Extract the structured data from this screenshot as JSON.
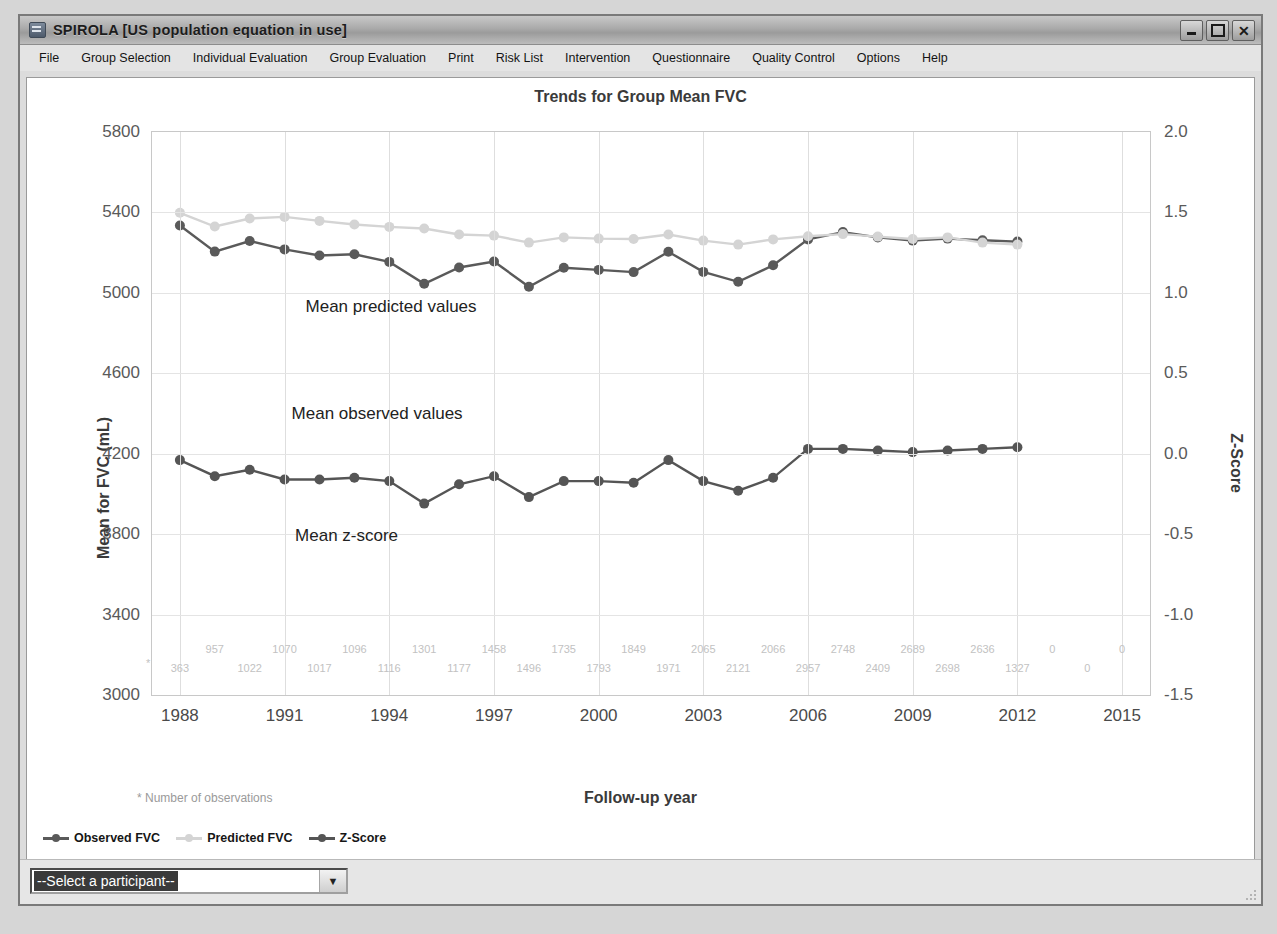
{
  "window": {
    "title": "SPIROLA  [US population equation in use]",
    "icon": "app-icon",
    "buttons": {
      "minimize": "minimize-icon",
      "maximize": "maximize-icon",
      "close": "close-icon"
    }
  },
  "menu": {
    "items": [
      "File",
      "Group Selection",
      "Individual Evaluation",
      "Group Evaluation",
      "Print",
      "Risk List",
      "Intervention",
      "Questionnaire",
      "Quality Control",
      "Options",
      "Help"
    ]
  },
  "statusbar": {
    "participant_select": "--Select a participant--",
    "dropdown_arrow": "chevron-down-icon"
  },
  "chart_data": {
    "type": "line",
    "title": "Trends for Group Mean FVC",
    "xlabel": "Follow-up year",
    "ylabel": "Mean for FVC (mL)",
    "ylabel_right": "Z-Score",
    "footnote": "* Number of observations",
    "grid": true,
    "legend_position": "bottom-left",
    "xlim": [
      1987.2,
      2015.8
    ],
    "xticks": [
      1988,
      1991,
      1994,
      1997,
      2000,
      2003,
      2006,
      2009,
      2012,
      2015
    ],
    "ylim": [
      3000,
      5800
    ],
    "yticks": [
      5800,
      5400,
      5000,
      4600,
      4200,
      3800,
      3400,
      3000
    ],
    "ylim_right": [
      -1.5,
      2.0
    ],
    "yticks_right": [
      "2.0",
      "1.5",
      "1.0",
      "0.5",
      "0.0",
      "-0.5",
      "-1.0",
      "-1.5"
    ],
    "x": [
      1988,
      1989,
      1990,
      1991,
      1992,
      1993,
      1994,
      1995,
      1996,
      1997,
      1998,
      1999,
      2000,
      2001,
      2002,
      2003,
      2004,
      2005,
      2006,
      2007,
      2008,
      2009,
      2010,
      2011,
      2012
    ],
    "series": [
      {
        "name": "Observed FVC",
        "axis": "left",
        "color": "#5a5a5a",
        "values": [
          5335,
          5205,
          5258,
          5216,
          5186,
          5192,
          5154,
          5045,
          5126,
          5156,
          5030,
          5125,
          5114,
          5103,
          5204,
          5104,
          5055,
          5137,
          5266,
          5302,
          5276,
          5260,
          5270,
          5262,
          5255
        ]
      },
      {
        "name": "Predicted FVC",
        "axis": "left",
        "color": "#d4d4d4",
        "values": [
          5398,
          5330,
          5370,
          5378,
          5358,
          5340,
          5328,
          5320,
          5290,
          5285,
          5250,
          5276,
          5270,
          5268,
          5290,
          5260,
          5240,
          5266,
          5282,
          5292,
          5280,
          5268,
          5276,
          5250,
          5240
        ]
      },
      {
        "name": "Z-Score",
        "axis": "right",
        "color": "#555555",
        "values": [
          -0.04,
          -0.14,
          -0.1,
          -0.16,
          -0.16,
          -0.15,
          -0.17,
          -0.31,
          -0.19,
          -0.14,
          -0.27,
          -0.17,
          -0.17,
          -0.18,
          -0.04,
          -0.17,
          -0.23,
          -0.15,
          0.03,
          0.03,
          0.02,
          0.01,
          0.02,
          0.03,
          0.04
        ]
      }
    ],
    "annotations": [
      {
        "text": "Mean predicted values",
        "x": 1991.6,
        "y_px": 218
      },
      {
        "text": "Mean observed values",
        "x": 1991.2,
        "y_px": 325
      },
      {
        "text": "Mean z-score",
        "x": 1991.3,
        "y_px": 447
      }
    ],
    "observation_counts_top": [
      "957",
      "1070",
      "1096",
      "1301",
      "1458",
      "1735",
      "1849",
      "2065",
      "2066",
      "2748",
      "2689",
      "2636",
      "0",
      "0"
    ],
    "observation_counts_bottom": [
      "363",
      "1022",
      "1017",
      "1116",
      "1177",
      "1496",
      "1793",
      "1971",
      "2121",
      "2957",
      "2409",
      "2698",
      "1327",
      "0"
    ],
    "observation_counts_top_x": [
      1989,
      1991,
      1993,
      1995,
      1997,
      1999,
      2001,
      2003,
      2005,
      2007,
      2009,
      2011,
      2013,
      2015
    ],
    "observation_counts_bottom_x": [
      1988,
      1990,
      1992,
      1994,
      1996,
      1998,
      2000,
      2002,
      2004,
      2006,
      2008,
      2010,
      2012,
      2014
    ]
  }
}
